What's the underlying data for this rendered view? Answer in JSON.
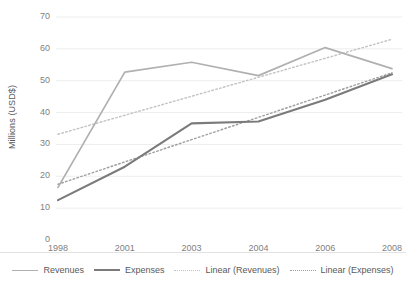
{
  "chart_data": {
    "type": "line",
    "title": "",
    "xlabel": "",
    "ylabel": "Millions (USD$)",
    "categories": [
      "1998",
      "2001",
      "2003",
      "2004",
      "2006",
      "2008"
    ],
    "ylim": [
      0,
      70
    ],
    "yticks": [
      0,
      10,
      20,
      30,
      40,
      50,
      60,
      70
    ],
    "ytick_labels": [
      "0",
      "10",
      "20",
      "30",
      "40",
      "50",
      "60",
      "70"
    ],
    "grid": true,
    "grid_axis": "y",
    "legend_position": "bottom",
    "series": [
      {
        "name": "Revenues",
        "style": "solid",
        "color": "#b0b0b0",
        "values": [
          16.5,
          52.7,
          55.8,
          51.6,
          60.4,
          53.8
        ]
      },
      {
        "name": "Expenses",
        "style": "solid",
        "color": "#7b7b7b",
        "values": [
          12.5,
          23.0,
          36.6,
          37.2,
          44.0,
          52.0
        ]
      },
      {
        "name": "Linear (Revenues)",
        "style": "dotted",
        "color": "#c2c2c2",
        "trendline_of": "Revenues",
        "endpoints": [
          33.2,
          63.0
        ]
      },
      {
        "name": "Linear (Expenses)",
        "style": "dotted",
        "color": "#9e9e9e",
        "trendline_of": "Expenses",
        "endpoints": [
          17.5,
          52.5
        ]
      }
    ]
  },
  "legend": {
    "items": [
      {
        "label": "Revenues"
      },
      {
        "label": "Expenses"
      },
      {
        "label": "Linear (Revenues)"
      },
      {
        "label": "Linear (Expenses)"
      }
    ]
  },
  "colors": {
    "revenues": "#b0b0b0",
    "expenses": "#7b7b7b",
    "trend_revenues": "#c2c2c2",
    "trend_expenses": "#9e9e9e",
    "gridline": "#ededed",
    "text": "#595959",
    "tick_text": "#7f7f7f",
    "background": "#ffffff"
  }
}
